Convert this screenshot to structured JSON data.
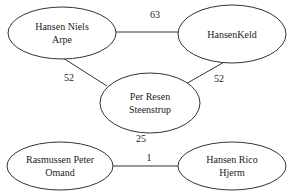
{
  "nodes": [
    {
      "id": "n1",
      "line1": "Hansen Niels",
      "line2": "Arpe",
      "cx": 62,
      "cy": 33,
      "rx": 54,
      "ry": 26
    },
    {
      "id": "n2",
      "line1": "HansenKeld",
      "line2": "",
      "cx": 232,
      "cy": 34,
      "rx": 54,
      "ry": 29
    },
    {
      "id": "n3",
      "line1": "Per Resen",
      "line2": "Steenstrup",
      "cx": 150,
      "cy": 103,
      "rx": 50,
      "ry": 30
    },
    {
      "id": "n4",
      "line1": "Rasmussen Peter",
      "line2": "Omand",
      "cx": 60,
      "cy": 166,
      "rx": 53,
      "ry": 24
    },
    {
      "id": "n5",
      "line1": "Hansen Rico",
      "line2": "Hjerm",
      "cx": 232,
      "cy": 166,
      "rx": 54,
      "ry": 24
    }
  ],
  "edges": [
    {
      "from": "n1",
      "to": "n2",
      "label": "63",
      "lx": 155,
      "ly": 14
    },
    {
      "from": "n1",
      "to": "n3",
      "label": "52",
      "lx": 69,
      "ly": 77
    },
    {
      "from": "n2",
      "to": "n3",
      "label": "52",
      "lx": 219,
      "ly": 78
    },
    {
      "from": "n3",
      "to": null,
      "label": "25",
      "lx": 141,
      "ly": 138
    },
    {
      "from": "n4",
      "to": "n5",
      "label": "1",
      "lx": 149,
      "ly": 157
    }
  ]
}
